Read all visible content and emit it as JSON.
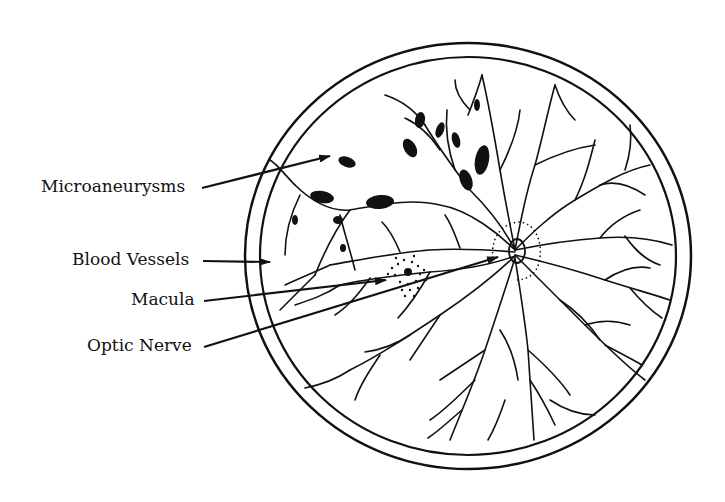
{
  "diagram": {
    "labels": [
      {
        "id": "microaneurysms",
        "text": "Microaneurysms"
      },
      {
        "id": "blood-vessels",
        "text": "Blood Vessels"
      },
      {
        "id": "macula",
        "text": "Macula"
      },
      {
        "id": "optic-nerve",
        "text": "Optic Nerve"
      }
    ],
    "colors": {
      "ink": "#111111",
      "background": "#ffffff"
    }
  }
}
